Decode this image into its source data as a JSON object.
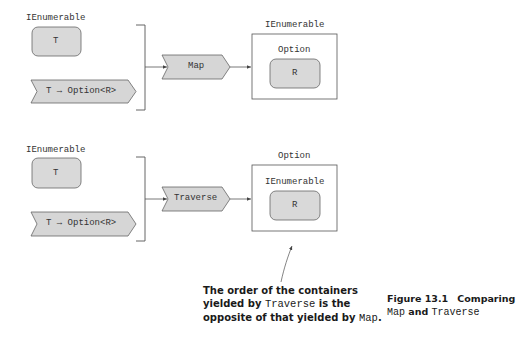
{
  "diagram": {
    "top": {
      "input_container_label": "IEnumerable",
      "input_element": "T",
      "function_label": "T → Option<R>",
      "operation": "Map",
      "output_outer_label": "IEnumerable",
      "output_inner_label": "Option",
      "output_element": "R"
    },
    "bottom": {
      "input_container_label": "IEnumerable",
      "input_element": "T",
      "function_label": "T → Option<R>",
      "operation": "Traverse",
      "output_outer_label": "Option",
      "output_inner_label": "IEnumerable",
      "output_element": "R"
    },
    "colors": {
      "shape_fill": "#d9d9d9",
      "stroke": "#555555",
      "text": "#333333"
    }
  },
  "annotation": {
    "part1": "The order of the containers yielded by ",
    "code1": "Traverse",
    "part2": " is the opposite of that yielded by ",
    "code2": "Map",
    "part3": "."
  },
  "caption": {
    "figure_number": "Figure 13.1",
    "title_prefix": "Comparing",
    "code1": "Map",
    "conjunction": " and ",
    "code2": "Traverse"
  }
}
